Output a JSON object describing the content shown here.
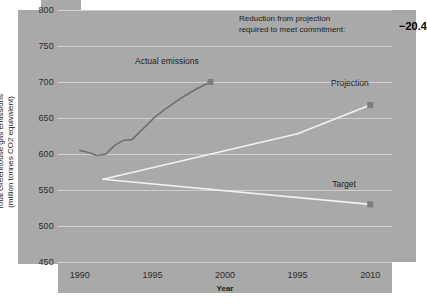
{
  "chart_data": {
    "type": "line",
    "title": "",
    "xlabel": "Year",
    "ylabel_line1": "Total Greenhouse gas emissions",
    "ylabel_line2": "(million tonnes CO2 equivalent)",
    "ylim": [
      450,
      800
    ],
    "yticks": [
      800,
      750,
      700,
      650,
      600,
      550,
      500,
      450
    ],
    "xlim": [
      1988.5,
      2011.5
    ],
    "xticks": [
      1990,
      1995,
      2000,
      1995,
      2010
    ],
    "xtick_positions": [
      1990,
      1995,
      2000,
      2005,
      2010
    ],
    "grid": true,
    "legend": "inline-point-labels",
    "series": [
      {
        "name": "Actual emissions",
        "color": "#6e6e6e",
        "label_x": 1996.0,
        "label_y": 722,
        "marker_at_end": true,
        "x": [
          1990,
          1990.6,
          1991.2,
          1991.8,
          1992.4,
          1993.0,
          1993.6,
          1994.4,
          1995.2,
          1996.0,
          1997.0,
          1998.0,
          1999.0
        ],
        "y": [
          605,
          602,
          598,
          600,
          612,
          619,
          620,
          636,
          652,
          664,
          678,
          690,
          700
        ]
      },
      {
        "name": "Projection",
        "color": "#f2f2f2",
        "label_x": 2008.6,
        "label_y": 692,
        "marker_at_end": true,
        "x": [
          1991.6,
          2005.0,
          2010.0
        ],
        "y": [
          565,
          628,
          668
        ]
      },
      {
        "name": "Target",
        "color": "#f2f2f2",
        "label_x": 2008.2,
        "label_y": 552,
        "marker_at_end": true,
        "x": [
          1991.6,
          2010.0
        ],
        "y": [
          565,
          530
        ]
      }
    ],
    "annotations": [
      {
        "name": "reduction-note",
        "line1": "Reduction from projection",
        "line2": "required to meet commitment:",
        "value": "−20.4"
      }
    ]
  },
  "colors": {
    "paper": "#a9a9a9",
    "grid": "#cfcfcf",
    "actual": "#6e6e6e",
    "projection": "#f2f2f2",
    "target": "#f2f2f2",
    "text": "#1c1c1c"
  }
}
